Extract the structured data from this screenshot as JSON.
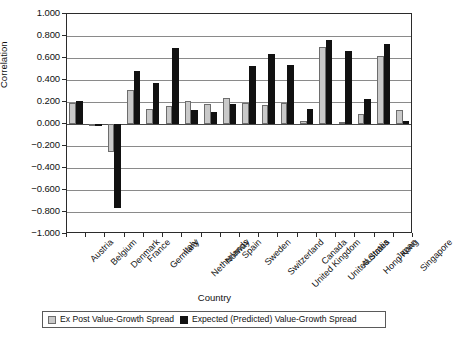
{
  "chart_data": {
    "type": "bar",
    "title": "",
    "xlabel": "Country",
    "ylabel": "Correlation",
    "ylim": [
      -1.0,
      1.0
    ],
    "ytick_labels": [
      "1.000",
      "0.800",
      "0.600",
      "0.400",
      "0.200",
      "0.000",
      "−0.200",
      "−0.400",
      "−0.600",
      "−0.800",
      "−1.000"
    ],
    "ytick_values": [
      1.0,
      0.8,
      0.6,
      0.4,
      0.2,
      0.0,
      -0.2,
      -0.4,
      -0.6,
      -0.8,
      -1.0
    ],
    "grid": true,
    "legend_position": "bottom",
    "categories": [
      "Austria",
      "Belgium",
      "Denmark",
      "France",
      "Germany",
      "Italy",
      "Netherlands",
      "Norway",
      "Spain",
      "Sweden",
      "Switzerland",
      "United Kingdom",
      "Canada",
      "United States",
      "Australia",
      "Hong Kong",
      "Japan",
      "Singapore"
    ],
    "series": [
      {
        "name": "Ex Post Value-Growth Spread",
        "color": "#c9c9c9",
        "values": [
          0.19,
          -0.02,
          -0.25,
          0.31,
          0.14,
          0.16,
          0.21,
          0.18,
          0.24,
          0.19,
          0.17,
          0.19,
          0.03,
          0.7,
          0.02,
          0.09,
          0.62,
          0.13
        ]
      },
      {
        "name": "Expected (Predicted) Value-Growth Spread",
        "color": "#111111",
        "values": [
          0.21,
          0.0,
          -0.76,
          0.48,
          0.37,
          0.69,
          0.13,
          0.11,
          0.18,
          0.53,
          0.64,
          0.54,
          0.14,
          0.76,
          0.66,
          0.23,
          0.73,
          0.03
        ]
      }
    ]
  }
}
